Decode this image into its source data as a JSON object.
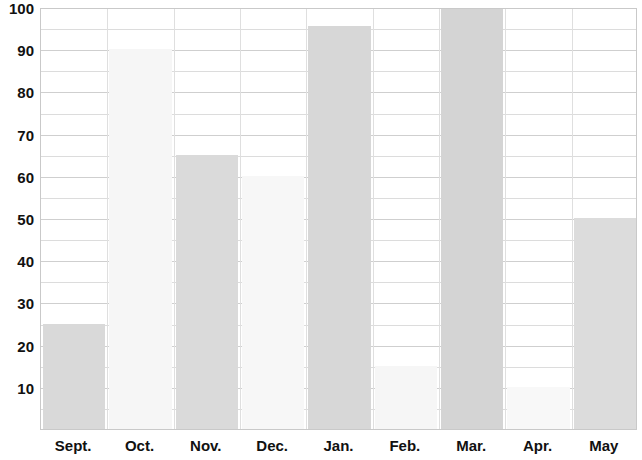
{
  "chart_data": {
    "type": "bar",
    "title": "",
    "xlabel": "",
    "ylabel": "",
    "categories": [
      "Sept.",
      "Oct.",
      "Nov.",
      "Dec.",
      "Jan.",
      "Feb.",
      "Mar.",
      "Apr.",
      "May"
    ],
    "values": [
      25,
      90,
      65,
      60,
      95.5,
      15,
      100,
      10,
      50
    ],
    "bar_colors": [
      "#d9d9d9",
      "#f6f6f6",
      "#dadada",
      "#f7f7f7",
      "#d7d7d7",
      "#f6f6f6",
      "#d4d4d4",
      "#f8f8f8",
      "#dcdcdc"
    ],
    "ylim": [
      0,
      100
    ],
    "y_tick_labels": [
      "10",
      "20",
      "30",
      "40",
      "50",
      "60",
      "70",
      "80",
      "90",
      "100"
    ],
    "y_tick_values": [
      10,
      20,
      30,
      40,
      50,
      60,
      70,
      80,
      90,
      100
    ],
    "y_gridline_values": [
      5,
      10,
      15,
      20,
      25,
      30,
      35,
      40,
      45,
      50,
      55,
      60,
      65,
      70,
      75,
      80,
      85,
      90,
      95,
      100
    ],
    "y_major_gridline_values": [
      10,
      20,
      30,
      40,
      50,
      60,
      70,
      80,
      90,
      100
    ],
    "grid": true,
    "legend": false,
    "legend_position": "none",
    "axis_color": "#c9c9c9",
    "grid_color": "#dcdcdc",
    "major_grid_color": "#cfcfcf",
    "text_color": "#111111",
    "background": "#ffffff"
  }
}
